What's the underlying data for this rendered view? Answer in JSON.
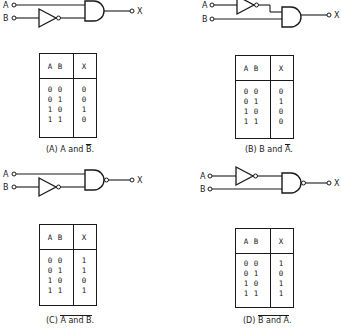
{
  "panels": [
    {
      "id": "A",
      "caption_prefix": "(A)",
      "caption_left": "A",
      "caption_mid": "and",
      "caption_right": "B",
      "caption_end": ".",
      "inverted_input": "B",
      "gate": "AND",
      "input_labels": [
        "A",
        "B"
      ],
      "output_label": "X",
      "table": {
        "headers": [
          "A",
          "B",
          "X"
        ],
        "rows": [
          [
            "0",
            "0",
            "0"
          ],
          [
            "0",
            "1",
            "0"
          ],
          [
            "1",
            "0",
            "1"
          ],
          [
            "1",
            "1",
            "0"
          ]
        ]
      }
    },
    {
      "id": "B",
      "caption_prefix": "(B)",
      "caption_left": "B",
      "caption_mid": "and",
      "caption_right": "A",
      "caption_end": ".",
      "inverted_input": "A",
      "gate": "AND",
      "input_labels": [
        "A",
        "B"
      ],
      "output_label": "X",
      "table": {
        "headers": [
          "A",
          "B",
          "X"
        ],
        "rows": [
          [
            "0",
            "0",
            "0"
          ],
          [
            "0",
            "1",
            "1"
          ],
          [
            "1",
            "0",
            "0"
          ],
          [
            "1",
            "1",
            "0"
          ]
        ]
      }
    },
    {
      "id": "C",
      "caption_prefix": "(C)",
      "caption_left": "A",
      "caption_mid": "and",
      "caption_right": "B",
      "caption_end": ".",
      "inverted_input": "B",
      "gate": "NAND",
      "input_labels": [
        "A",
        "B"
      ],
      "output_label": "X",
      "table": {
        "headers": [
          "A",
          "B",
          "X"
        ],
        "rows": [
          [
            "0",
            "0",
            "1"
          ],
          [
            "0",
            "1",
            "1"
          ],
          [
            "1",
            "0",
            "0"
          ],
          [
            "1",
            "1",
            "1"
          ]
        ]
      }
    },
    {
      "id": "D",
      "caption_prefix": "(D)",
      "caption_left": "B",
      "caption_mid": "and",
      "caption_right": "A",
      "caption_end": ".",
      "inverted_input": "A",
      "gate": "NAND",
      "input_labels": [
        "A",
        "B"
      ],
      "output_label": "X",
      "table": {
        "headers": [
          "A",
          "B",
          "X"
        ],
        "rows": [
          [
            "0",
            "0",
            "1"
          ],
          [
            "0",
            "1",
            "0"
          ],
          [
            "1",
            "0",
            "1"
          ],
          [
            "1",
            "1",
            "1"
          ]
        ]
      }
    }
  ],
  "colors": {
    "ink": "#1a1a1a",
    "background": "#ffffff"
  }
}
